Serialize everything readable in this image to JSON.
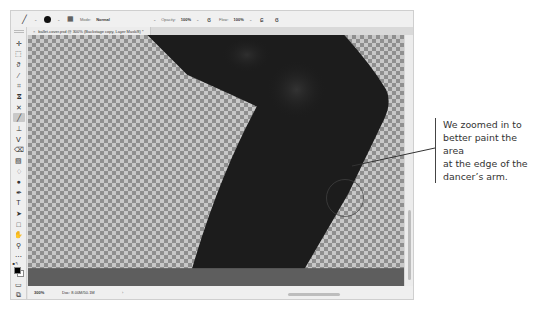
{
  "options_bar": {
    "tool_icon": "brush-icon",
    "brush_size": "",
    "mode_label": "Mode:",
    "mode_value": "Normal",
    "opacity_label": "Opacity:",
    "opacity_value": "100%",
    "flow_label": "Flow:",
    "flow_value": "100%",
    "icons": [
      "brush-preset-icon",
      "brush-settings-icon",
      "pressure-opacity-icon",
      "airbrush-icon",
      "pressure-size-icon"
    ]
  },
  "document": {
    "tab_title": "ballet-cover.psd @ 300% (Backstage copy, Layer Mask/8) *",
    "tab_close": "×"
  },
  "toolbar": {
    "tools": [
      {
        "name": "move-tool",
        "glyph": "✛"
      },
      {
        "name": "marquee-tool",
        "glyph": "⬚"
      },
      {
        "name": "lasso-tool",
        "glyph": "ϑ"
      },
      {
        "name": "quick-select-tool",
        "glyph": "⁄"
      },
      {
        "name": "crop-tool",
        "glyph": "⌗"
      },
      {
        "name": "eyedropper-tool",
        "glyph": "ⴵ"
      },
      {
        "name": "healing-tool",
        "glyph": "✕"
      },
      {
        "name": "brush-tool",
        "glyph": "╱",
        "active": true
      },
      {
        "name": "stamp-tool",
        "glyph": "⊥"
      },
      {
        "name": "history-brush-tool",
        "glyph": "ⴸ"
      },
      {
        "name": "eraser-tool",
        "glyph": "⌫"
      },
      {
        "name": "gradient-tool",
        "glyph": "▧"
      },
      {
        "name": "blur-tool",
        "glyph": "♢"
      },
      {
        "name": "dodge-tool",
        "glyph": "●"
      },
      {
        "name": "pen-tool",
        "glyph": "✒"
      },
      {
        "name": "type-tool",
        "glyph": "T"
      },
      {
        "name": "path-select-tool",
        "glyph": "➤"
      },
      {
        "name": "shape-tool",
        "glyph": "□"
      },
      {
        "name": "hand-tool",
        "glyph": "✋"
      },
      {
        "name": "zoom-tool",
        "glyph": "⚲"
      },
      {
        "name": "more-tools",
        "glyph": "⋯"
      }
    ],
    "foreground_color": "#000000",
    "background_color": "#ffffff",
    "bottom": [
      {
        "name": "quick-mask-tool",
        "glyph": "▭"
      },
      {
        "name": "screen-mode-tool",
        "glyph": "⧉"
      }
    ]
  },
  "status_bar": {
    "zoom": "300%",
    "doc_info": "Doc: 8.00M/50.1M",
    "arrow": "›"
  },
  "callout": {
    "text": "We zoomed in to\nbetter paint the area\nat the edge of the\ndancer’s arm."
  },
  "colors": {
    "arm": "#1c1c1c",
    "pasteboard": "#5e5e5e",
    "checker_dark": "#8f8f8f",
    "checker_light": "#c8c8c8"
  }
}
